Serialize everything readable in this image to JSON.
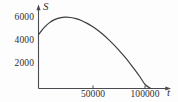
{
  "figure": {
    "background_color": "#fdfdfd",
    "ink_color": "#3a3a40",
    "axis_label_x": "t",
    "axis_label_y": "S"
  },
  "chart_data": {
    "type": "line",
    "title": "",
    "subtitle": "",
    "xlabel": "t",
    "ylabel": "S",
    "grid": false,
    "legend": null,
    "xlim": [
      0,
      120000
    ],
    "ylim": [
      0,
      7000
    ],
    "x_ticks": [
      50000,
      100000
    ],
    "x_tick_labels": [
      "50000",
      "100000"
    ],
    "y_ticks": [
      2000,
      4000,
      6000
    ],
    "y_tick_labels": [
      "2000",
      "4000",
      "6000"
    ],
    "annotations": [],
    "series": [
      {
        "name": "S(t)",
        "style": "smooth-curve",
        "color": "#3a3a40",
        "x": [
          0,
          5000,
          10000,
          15000,
          20000,
          25000,
          30000,
          35000,
          40000,
          45000,
          50000,
          55000,
          60000,
          65000,
          70000,
          75000,
          80000,
          85000,
          90000,
          95000,
          100000,
          105000,
          108000
        ],
        "y": [
          4800,
          5400,
          5850,
          6140,
          6300,
          6360,
          6330,
          6230,
          6060,
          5830,
          5550,
          5220,
          4840,
          4410,
          3940,
          3430,
          2880,
          2290,
          1660,
          1000,
          310,
          0,
          0
        ]
      }
    ]
  }
}
